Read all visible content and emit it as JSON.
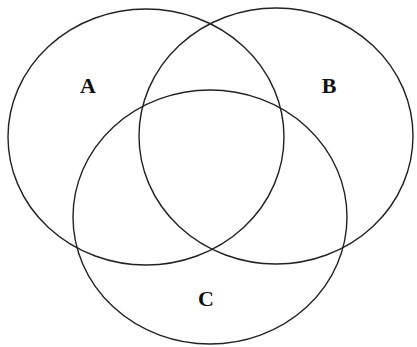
{
  "diagram": {
    "type": "venn",
    "set_count": 3,
    "colors": {
      "background": "#ffffff",
      "stroke": "#222222",
      "label": "#111111"
    },
    "sets": [
      {
        "id": "A",
        "label": "A",
        "ellipse": {
          "cx": 146,
          "cy": 137,
          "rx": 138,
          "ry": 128
        },
        "label_pos": {
          "x": 88,
          "y": 93
        }
      },
      {
        "id": "B",
        "label": "B",
        "ellipse": {
          "cx": 276,
          "cy": 136,
          "rx": 137,
          "ry": 128
        },
        "label_pos": {
          "x": 329,
          "y": 93
        }
      },
      {
        "id": "C",
        "label": "C",
        "ellipse": {
          "cx": 210,
          "cy": 217,
          "rx": 137,
          "ry": 127
        },
        "label_pos": {
          "x": 206,
          "y": 306
        }
      }
    ]
  }
}
